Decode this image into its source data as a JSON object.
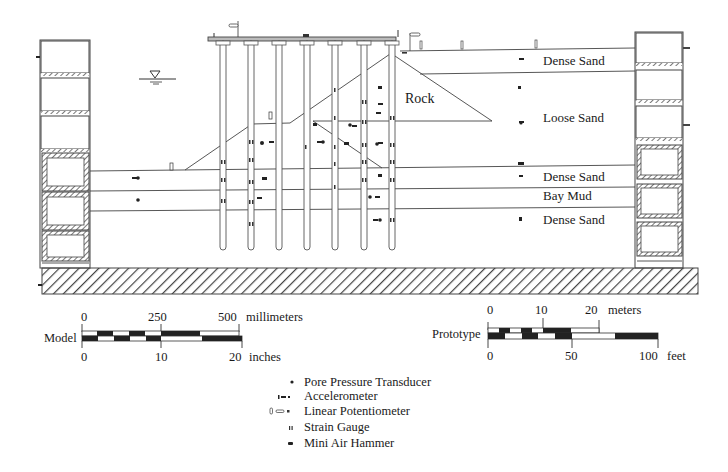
{
  "diagram": {
    "type": "centrifuge-model-cross-section",
    "layers": [
      {
        "id": "dense-sand-top",
        "label": "Dense Sand"
      },
      {
        "id": "loose-sand",
        "label": "Loose Sand"
      },
      {
        "id": "dense-sand-mid",
        "label": "Dense Sand"
      },
      {
        "id": "bay-mud",
        "label": "Bay Mud"
      },
      {
        "id": "dense-sand-bottom",
        "label": "Dense Sand"
      }
    ],
    "rock_label": "Rock",
    "pile_count": 7,
    "water_table_symbol": "inverted-triangle"
  },
  "scales": {
    "model": {
      "label": "Model",
      "top_unit": "millimeters",
      "top_ticks": [
        "0",
        "250",
        "500"
      ],
      "bottom_unit": "inches",
      "bottom_ticks": [
        "0",
        "10",
        "20"
      ]
    },
    "prototype": {
      "label": "Prototype",
      "top_unit": "meters",
      "top_ticks": [
        "0",
        "10",
        "20"
      ],
      "bottom_unit": "feet",
      "bottom_ticks": [
        "0",
        "50",
        "100"
      ]
    }
  },
  "legend": {
    "items": [
      {
        "icon": "dot-icon",
        "label": "Pore Pressure Transducer"
      },
      {
        "icon": "dash-icon",
        "label": "Accelerometer"
      },
      {
        "icon": "capsule-icon",
        "label": "Linear Potentiometer"
      },
      {
        "icon": "double-tick-icon",
        "label": "Strain Gauge"
      },
      {
        "icon": "block-icon",
        "label": "Mini Air Hammer"
      }
    ]
  },
  "colors": {
    "ink": "#1a1a1a",
    "line": "#444444",
    "background": "#ffffff"
  }
}
